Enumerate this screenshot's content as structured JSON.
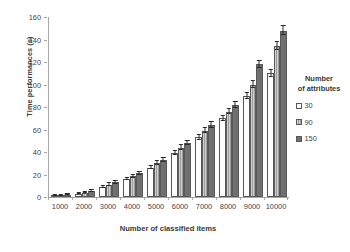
{
  "chart_data": {
    "type": "bar",
    "title": "",
    "xlabel": "Number of classified items",
    "ylabel": "Time performances (s)",
    "categories": [
      "1000",
      "2000",
      "3000",
      "4000",
      "5000",
      "6000",
      "7000",
      "8000",
      "9000",
      "10000"
    ],
    "ylim": [
      0,
      160
    ],
    "yticks": [
      0,
      20,
      40,
      60,
      80,
      100,
      120,
      140,
      160
    ],
    "grid": false,
    "legend_position": "right",
    "legend_title": "Number of attributes",
    "series": [
      {
        "name": "30",
        "color": "#fefefe",
        "values": [
          1,
          3,
          9,
          16,
          26,
          39,
          53,
          70,
          90,
          110
        ],
        "errors": [
          0.5,
          0.7,
          1.0,
          1.2,
          1.5,
          1.8,
          2.0,
          2.2,
          2.6,
          3.0
        ]
      },
      {
        "name": "90",
        "color": "#b9b9b9",
        "values": [
          1.5,
          4,
          11,
          18.5,
          30,
          44,
          59,
          76,
          100,
          134
        ],
        "errors": [
          0.5,
          0.8,
          1.1,
          1.3,
          1.6,
          1.9,
          2.1,
          2.4,
          2.8,
          3.4
        ]
      },
      {
        "name": "150",
        "color": "#6f6f6f",
        "values": [
          2,
          5,
          13,
          21,
          33,
          48,
          64,
          82,
          118,
          148
        ],
        "errors": [
          0.6,
          0.9,
          1.2,
          1.4,
          1.7,
          2.0,
          2.3,
          2.6,
          3.2,
          3.8
        ]
      }
    ]
  },
  "axes": {
    "y_title": "Time performances (s)",
    "x_title": "Number of classified items",
    "y_tick_labels": [
      "160",
      "140",
      "120",
      "100",
      "80",
      "60",
      "40",
      "20",
      "0"
    ],
    "x_tick_labels": [
      "1000",
      "2000",
      "3000",
      "4000",
      "5000",
      "6000",
      "7000",
      "8000",
      "9000",
      "10000"
    ]
  },
  "legend": {
    "title_line1": "Number",
    "title_line2": "of attributes",
    "entries": [
      {
        "label": "30"
      },
      {
        "label": "90"
      },
      {
        "label": "150"
      }
    ]
  }
}
